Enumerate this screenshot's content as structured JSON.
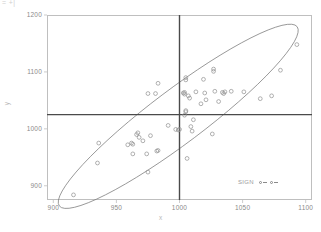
{
  "title_fragment": "= +|",
  "axes": {
    "xlabel": "x",
    "ylabel": "y",
    "x_ticks": [
      "900",
      "950",
      "1000",
      "1050",
      "1100"
    ],
    "y_ticks": [
      "1200",
      "1100",
      "1000",
      "900"
    ]
  },
  "legend": {
    "title": "SIGN",
    "entries": [
      {
        "marker": "circle-dash"
      },
      {
        "marker": "circle-dash"
      }
    ]
  },
  "colors": {
    "frame": "#bfbfbf",
    "point": "#8f8f8f",
    "ellipse": "#7a7a7a",
    "refline": "#4a4a4a",
    "tick_text": "#8a8a8a"
  },
  "chart_data": {
    "type": "scatter",
    "title": "",
    "xlabel": "x",
    "ylabel": "y",
    "xlim": [
      895,
      1105
    ],
    "ylim": [
      875,
      1200
    ],
    "grid": false,
    "legend_position": "bottom-right",
    "legend_title": "SIGN",
    "x_ticks": [
      900,
      950,
      1000,
      1050,
      1100
    ],
    "y_ticks": [
      900,
      1000,
      1100,
      1200
    ],
    "reference_lines": [
      {
        "orientation": "vertical",
        "value": 1000
      },
      {
        "orientation": "horizontal",
        "value": 1025
      }
    ],
    "ellipse": {
      "center_x": 999,
      "center_y": 1022,
      "semi_major": 118,
      "semi_minor": 47,
      "angle_deg": 37,
      "description": "95% confidence ellipse"
    },
    "points": [
      {
        "x": 916,
        "y": 884
      },
      {
        "x": 935,
        "y": 940
      },
      {
        "x": 936,
        "y": 975
      },
      {
        "x": 959,
        "y": 972
      },
      {
        "x": 962,
        "y": 975
      },
      {
        "x": 963,
        "y": 973
      },
      {
        "x": 963,
        "y": 956
      },
      {
        "x": 966,
        "y": 990
      },
      {
        "x": 967,
        "y": 993
      },
      {
        "x": 968,
        "y": 985
      },
      {
        "x": 971,
        "y": 979
      },
      {
        "x": 974,
        "y": 956
      },
      {
        "x": 975,
        "y": 924
      },
      {
        "x": 975,
        "y": 1062
      },
      {
        "x": 977,
        "y": 988
      },
      {
        "x": 981,
        "y": 1062
      },
      {
        "x": 982,
        "y": 961
      },
      {
        "x": 983,
        "y": 962
      },
      {
        "x": 983,
        "y": 1080
      },
      {
        "x": 991,
        "y": 1006
      },
      {
        "x": 997,
        "y": 999
      },
      {
        "x": 999,
        "y": 998
      },
      {
        "x": 1000,
        "y": 999
      },
      {
        "x": 1003,
        "y": 1063
      },
      {
        "x": 1004,
        "y": 1064
      },
      {
        "x": 1004,
        "y": 1061
      },
      {
        "x": 1004,
        "y": 1024
      },
      {
        "x": 1005,
        "y": 1090
      },
      {
        "x": 1005,
        "y": 1086
      },
      {
        "x": 1005,
        "y": 1032
      },
      {
        "x": 1005,
        "y": 1030
      },
      {
        "x": 1006,
        "y": 948
      },
      {
        "x": 1007,
        "y": 1058
      },
      {
        "x": 1008,
        "y": 1054
      },
      {
        "x": 1009,
        "y": 1004
      },
      {
        "x": 1010,
        "y": 996
      },
      {
        "x": 1011,
        "y": 1016
      },
      {
        "x": 1013,
        "y": 1065
      },
      {
        "x": 1017,
        "y": 1044
      },
      {
        "x": 1019,
        "y": 1087
      },
      {
        "x": 1020,
        "y": 1063
      },
      {
        "x": 1021,
        "y": 1051
      },
      {
        "x": 1026,
        "y": 991
      },
      {
        "x": 1027,
        "y": 1101
      },
      {
        "x": 1027,
        "y": 1105
      },
      {
        "x": 1028,
        "y": 1066
      },
      {
        "x": 1031,
        "y": 1048
      },
      {
        "x": 1034,
        "y": 1064
      },
      {
        "x": 1035,
        "y": 1062
      },
      {
        "x": 1036,
        "y": 1065
      },
      {
        "x": 1041,
        "y": 1066
      },
      {
        "x": 1051,
        "y": 1065
      },
      {
        "x": 1064,
        "y": 1053
      },
      {
        "x": 1073,
        "y": 1058
      },
      {
        "x": 1080,
        "y": 1103
      },
      {
        "x": 1093,
        "y": 1148
      }
    ]
  }
}
